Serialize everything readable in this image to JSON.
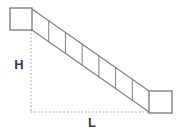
{
  "diagram": {
    "type": "inclined-ladder-physics-diagram",
    "background_color": "#ffffff",
    "stroke_color": "#808080",
    "guide_color": "#9a9a9a",
    "label_color": "#3c3c3c",
    "labels": {
      "height": "H",
      "length": "L"
    },
    "blocks": [
      {
        "name": "upper-block",
        "x": 10,
        "y": 8,
        "width": 22,
        "height": 22
      },
      {
        "name": "lower-block",
        "x": 149,
        "y": 91,
        "width": 23,
        "height": 22
      }
    ],
    "beam": {
      "top_start": {
        "x": 32,
        "y": 9
      },
      "top_end": {
        "x": 149,
        "y": 91
      },
      "bottom_start": {
        "x": 32,
        "y": 30
      },
      "bottom_end": {
        "x": 149,
        "y": 112
      },
      "rung_count": 6
    },
    "guides": {
      "vertical": {
        "x": 31,
        "y_top": 30,
        "y_bottom": 113
      },
      "horizontal": {
        "y": 112,
        "x_left": 31,
        "x_right": 150
      }
    },
    "label_positions": {
      "height": {
        "x": 19,
        "y": 69
      },
      "length": {
        "x": 92,
        "y": 127
      }
    }
  }
}
